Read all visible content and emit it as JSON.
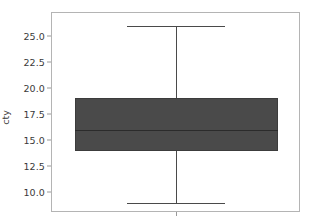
{
  "chart_data": {
    "type": "box",
    "title": "",
    "xlabel": "",
    "ylabel": "cty",
    "ylim": [
      8.1,
      27.3
    ],
    "grid": false,
    "legend": null,
    "categories": [
      ""
    ],
    "yticks": [
      "25.0",
      "22.5",
      "20.0",
      "17.5",
      "15.0",
      "12.5",
      "10.0"
    ],
    "ytick_values": [
      25.0,
      22.5,
      20.0,
      17.5,
      15.0,
      12.5,
      10.0
    ],
    "xticks": [
      ""
    ],
    "series": [
      {
        "name": "cty",
        "whisker_low": 9.0,
        "q1": 14.0,
        "median": 16.0,
        "q3": 19.0,
        "whisker_high": 26.0,
        "outliers": []
      }
    ],
    "colors": {
      "box_fill": "#4a4a4a",
      "box_edge": "#3c3c3c",
      "median": "#2b2b2b",
      "whisker": "#4a4a4a",
      "axis": "#b4b4b4",
      "tick_text": "#3a3a3a",
      "background": "#ffffff"
    }
  },
  "axis": {
    "ytick_0": "25.0",
    "ytick_1": "22.5",
    "ytick_2": "20.0",
    "ytick_3": "17.5",
    "ytick_4": "15.0",
    "ytick_5": "12.5",
    "ytick_6": "10.0",
    "ylabel": "cty",
    "xtick_0": ""
  }
}
